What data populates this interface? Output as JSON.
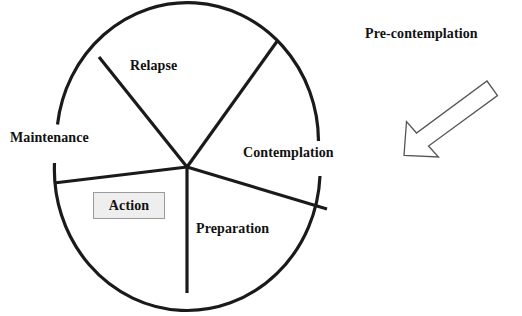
{
  "diagram": {
    "wheel": {
      "segments": [
        {
          "id": "relapse",
          "label": "Relapse"
        },
        {
          "id": "contemplation",
          "label": "Contemplation"
        },
        {
          "id": "preparation",
          "label": "Preparation"
        },
        {
          "id": "action",
          "label": "Action"
        },
        {
          "id": "maintenance",
          "label": "Maintenance"
        }
      ],
      "stroke_color": "#1a1a1a",
      "fill_color": "#ffffff"
    },
    "external": {
      "label": "Pre-contemplation",
      "arrow": {
        "name": "arrow-down-left",
        "stroke_color": "#555555",
        "fill_color": "#ffffff"
      }
    },
    "action_box": {
      "label": "Action",
      "fill_color": "#eeeeee",
      "border_color": "#9a9a9a"
    },
    "background_color": "#ffffff"
  }
}
